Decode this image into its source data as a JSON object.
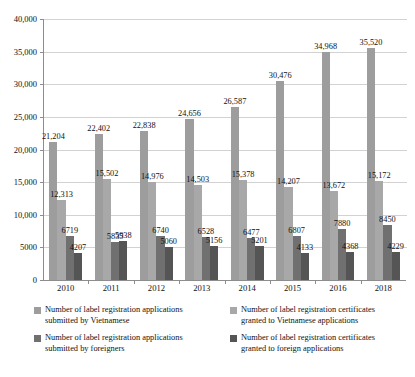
{
  "chart_data": {
    "type": "bar",
    "title": "",
    "subtitle": "",
    "xlabel": "",
    "ylabel": "",
    "grid": true,
    "legend_position": "bottom",
    "ylim": [
      0,
      40000
    ],
    "yticks": [
      0,
      5000,
      10000,
      15000,
      20000,
      25000,
      30000,
      35000,
      40000
    ],
    "ytick_labels": [
      "0",
      "5000",
      "10,000",
      "15,000",
      "20,000",
      "25,000",
      "30,000",
      "35,000",
      "40,000"
    ],
    "categories": [
      "2010",
      "2011",
      "2012",
      "2013",
      "2014",
      "2015",
      "2016",
      "2018"
    ],
    "series": [
      {
        "name": "Number of label registration applications submitted by Vietnamese",
        "color": "#9d9d9d",
        "values": [
          21204,
          22402,
          22838,
          24656,
          26587,
          30476,
          34968,
          35520
        ],
        "labels": [
          "21,204",
          "22,402",
          "22,838",
          "24,656",
          "26,587",
          "30,476",
          "34,968",
          "35,520"
        ]
      },
      {
        "name": "Number of label registration certificates granted to Vietnamese applications",
        "color": "#a8a8a8",
        "values": [
          12313,
          15502,
          14976,
          14503,
          15378,
          14207,
          13672,
          15172
        ],
        "labels": [
          "12,313",
          "15,502",
          "14,976",
          "14,503",
          "15,378",
          "14,207",
          "13,672",
          "15,172"
        ]
      },
      {
        "name": "Number of label registration applications submitted by foreigners",
        "color": "#707070",
        "values": [
          6719,
          5835,
          6740,
          6528,
          6477,
          6807,
          7880,
          8450
        ],
        "labels": [
          "6719",
          "5835",
          "6740",
          "6528",
          "6477",
          "6807",
          "7880",
          "8450"
        ]
      },
      {
        "name": "Number of label registration certificates granted to foreign applications",
        "color": "#555555",
        "values": [
          4207,
          5938,
          5060,
          5156,
          5201,
          4133,
          4368,
          4229
        ],
        "labels": [
          "4207",
          "5938",
          "5060",
          "5156",
          "5201",
          "4133",
          "4368",
          "4229"
        ]
      }
    ]
  },
  "legend": {
    "items": [
      {
        "label": "Number of label registration applications submitted by Vietnamese",
        "color": "#9d9d9d"
      },
      {
        "label": "Number of label registration applications submitted by foreigners",
        "color": "#707070"
      },
      {
        "label": "Number of label registration certificates granted to Vietnamese applications",
        "color": "#a8a8a8"
      },
      {
        "label": "Number of label registration certificates granted to foreign applications",
        "color": "#555555"
      }
    ]
  }
}
